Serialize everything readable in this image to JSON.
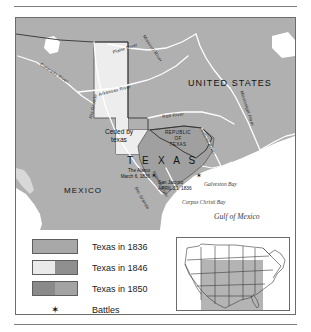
{
  "figure": {
    "title_text": "",
    "map": {
      "countries": [
        {
          "name": "united-states",
          "label": "UNITED STATES"
        },
        {
          "name": "mexico",
          "label": "MEXICO"
        }
      ],
      "texas_label": "T E X A S",
      "republic_label_lines": [
        "REPUBLIC",
        "OF",
        "TEXAS"
      ],
      "ceded_label_lines": [
        "Ceded by",
        "texas"
      ],
      "battles": [
        {
          "name": "the-alamo",
          "lines": [
            "The Alamo",
            "March 6, 1836"
          ]
        },
        {
          "name": "san-jacinto",
          "lines": [
            "San Jacinto",
            "APRIL 21, 1836"
          ]
        }
      ],
      "waters": [
        {
          "name": "galveston-bay",
          "label": "Galveston Bay"
        },
        {
          "name": "corpus-christi-bay",
          "label": "Corpus Christi Bay"
        },
        {
          "name": "gulf-of-mexico",
          "label": "Gulf of Mexico"
        }
      ],
      "rivers": [
        {
          "name": "colorado-river",
          "label": "Colorado River"
        },
        {
          "name": "arkansas-river",
          "label": "Arkansas River"
        },
        {
          "name": "platte-river",
          "label": "Platte River"
        },
        {
          "name": "missouri-river",
          "label": "Missouri River"
        },
        {
          "name": "mississippi-river",
          "label": "Mississippi River"
        },
        {
          "name": "red-river",
          "label": "Red   River"
        },
        {
          "name": "sabine-river",
          "label": "Sabine River"
        },
        {
          "name": "rio-grande-north",
          "label": "Rio Grande"
        },
        {
          "name": "rio-grande-south",
          "label": "Rio Grande"
        },
        {
          "name": "nueces-river",
          "label": "Nueces River"
        }
      ]
    },
    "legend": {
      "items": [
        {
          "name": "texas-1836",
          "label": "Texas in 1836",
          "left_color": "#a8a8a8",
          "right_color": "#a8a8a8"
        },
        {
          "name": "texas-1846",
          "label": "Texas in 1846",
          "left_color": "#eaeaea",
          "right_color": "#8f8f8f"
        },
        {
          "name": "texas-1850",
          "label": "Texas in 1850",
          "left_color": "#8a8a8a",
          "right_color": "#a3a3a3"
        }
      ],
      "battles_label": "Battles",
      "battles_marker": "✶"
    },
    "inset": {
      "name": "united-states-locator-map",
      "highlight_color": "#b4b4b4"
    }
  },
  "colors": {
    "land_gray": "#b0b0b0",
    "ceded_light": "#ededed",
    "water_white": "#ffffff",
    "outline": "#5e5e5e",
    "rule": "#7d7d7d"
  }
}
